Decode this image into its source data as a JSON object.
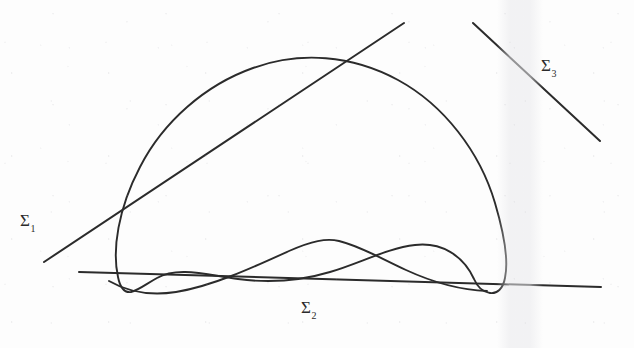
{
  "figure": {
    "kind": "hand-drawn-mathematical-diagram",
    "background_color": "#fdfdfd",
    "ink_color": "#2b2b2b",
    "width": 634,
    "height": 348
  },
  "labels": {
    "sigma1": {
      "base": "Σ",
      "subscript": "1",
      "x": 20,
      "y": 212
    },
    "sigma2": {
      "base": "Σ",
      "subscript": "2",
      "x": 301,
      "y": 299
    },
    "sigma3": {
      "base": "Σ",
      "subscript": "3",
      "x": 541,
      "y": 57
    }
  },
  "strokes": {
    "closed_curve": {
      "name": "closed-curve",
      "path": "M 118 277 C 112 250 118 209 140 167 C 163 122 205 85 253 68 C 300 51 352 55 398 80 C 444 105 480 152 495 203 C 506 240 508 264 505 278 C 503 289 497 294 490 293 C 482 292 477 286 474 279 C 463 255 441 242 415 245 C 388 248 358 264 330 272 C 300 281 268 283 238 279 C 207 275 178 266 157 278 C 146 284 139 290 131 292 C 124 293 120 287 118 277 Z"
    },
    "inner_hump": {
      "name": "inner-hump-curve",
      "path": "M 109 281 C 128 292 150 296 176 292 C 213 286 254 267 289 251 C 312 241 326 238 339 241 C 360 246 382 259 406 270 C 432 282 460 290 487 291"
    },
    "line_sigma1": {
      "name": "line-sigma-1",
      "x1": 44,
      "y1": 262,
      "x2": 404,
      "y2": 23
    },
    "line_sigma2": {
      "name": "line-sigma-2",
      "x1": 79,
      "y1": 272,
      "x2": 601,
      "y2": 287
    },
    "line_sigma3": {
      "name": "line-sigma-3",
      "x1": 473,
      "y1": 23,
      "x2": 600,
      "y2": 141
    }
  }
}
